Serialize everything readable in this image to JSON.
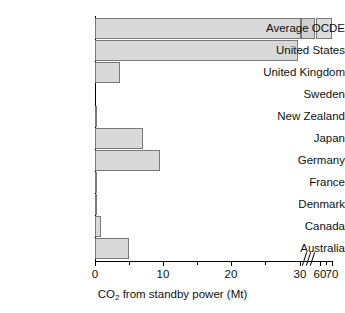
{
  "chart_data": {
    "type": "bar",
    "orientation": "horizontal",
    "title": "",
    "xlabel": "CO2 from standby power (Mt)",
    "xlabel_parts": {
      "prefix": "CO",
      "sub": "2",
      "suffix": " from standby power (Mt)"
    },
    "ylabel": "",
    "categories": [
      "Average OCDE",
      "United States",
      "United Kingdom",
      "Sweden",
      "New Zealand",
      "Japan",
      "Germany",
      "France",
      "Denmark",
      "Canada",
      "Australia"
    ],
    "values": [
      70,
      29.5,
      3.6,
      0,
      0.15,
      7.1,
      9.6,
      0.2,
      0.25,
      0.9,
      5.0
    ],
    "xlim": [
      0,
      70
    ],
    "axis_break": {
      "from": 30,
      "to": 60,
      "present": true
    },
    "xticks_major": [
      0,
      10,
      20,
      30,
      60,
      70
    ],
    "xtick_labels": [
      "0",
      "10",
      "20",
      "30",
      "60",
      "70"
    ],
    "xticks_minor": [
      5,
      15,
      25,
      65
    ],
    "grid": false,
    "legend": false,
    "bar_color": "#d9d9d9",
    "bar_edge_color": "#7a7a7a",
    "axis_color": "#000000"
  },
  "axis": {
    "title_prefix": "CO",
    "title_sub": "2",
    "title_suffix": " from standby power (Mt)"
  },
  "ticks": [
    {
      "label": "0",
      "x": 95
    },
    {
      "label": "10",
      "x": 163
    },
    {
      "label": "20",
      "x": 231
    },
    {
      "label": "30",
      "x": 300
    },
    {
      "label": "60",
      "x": 320
    },
    {
      "label": "70",
      "x": 332
    }
  ],
  "minor_ticks": [
    129,
    197,
    265,
    326
  ],
  "rows": [
    {
      "label": "Average OCDE",
      "top": 18,
      "segments": [
        {
          "left": 0,
          "width": 206
        },
        {
          "left": 206,
          "width": 14
        },
        {
          "left": 221,
          "width": 16
        }
      ]
    },
    {
      "label": "United States",
      "top": 40,
      "segments": [
        {
          "left": 0,
          "width": 203
        }
      ]
    },
    {
      "label": "United Kingdom",
      "top": 62,
      "segments": [
        {
          "left": 0,
          "width": 25
        }
      ]
    },
    {
      "label": "Sweden",
      "top": 84,
      "segments": [
        {
          "left": 0,
          "width": 0
        }
      ]
    },
    {
      "label": "New Zealand",
      "top": 106,
      "segments": [
        {
          "left": 0,
          "width": 1
        }
      ]
    },
    {
      "label": "Japan",
      "top": 128,
      "segments": [
        {
          "left": 0,
          "width": 48
        }
      ]
    },
    {
      "label": "Germany",
      "top": 150,
      "segments": [
        {
          "left": 0,
          "width": 65
        }
      ]
    },
    {
      "label": "France",
      "top": 172,
      "segments": [
        {
          "left": 0,
          "width": 2
        }
      ]
    },
    {
      "label": "Denmark",
      "top": 194,
      "segments": [
        {
          "left": 0,
          "width": 2
        }
      ]
    },
    {
      "label": "Canada",
      "top": 216,
      "segments": [
        {
          "left": 0,
          "width": 6
        }
      ]
    },
    {
      "label": "Australia",
      "top": 238,
      "segments": [
        {
          "left": 0,
          "width": 34
        }
      ]
    }
  ]
}
